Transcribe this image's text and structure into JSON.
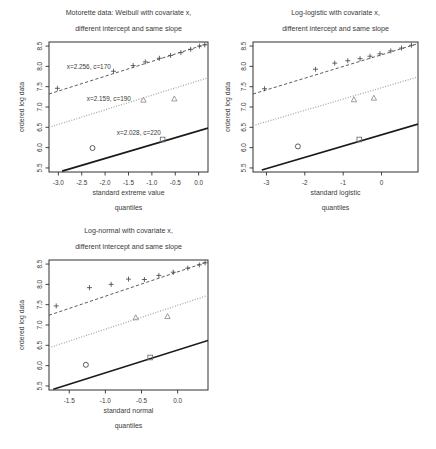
{
  "figure": {
    "panel_count": 3,
    "ylabel_common": "ordered log data",
    "yticks": [
      "5.5",
      "6.0",
      "6.5",
      "7.0",
      "7.5",
      "8.0",
      "8.5"
    ],
    "colors": {
      "line_solid": "#1a1a1a",
      "line_dashed": "#4a4a4a",
      "line_dotted": "#a8a8a8",
      "frame": "#303030",
      "text": "#3a3a3a",
      "background": "#ffffff"
    }
  },
  "chart_data": [
    {
      "type": "scatter",
      "id": "weibull",
      "title_line1": "Motorette data: Weibull with covariate x,",
      "title_line2": "different intercept and same slope",
      "xlabel_line1": "standard extreme value",
      "xlabel_line2": "quantiles",
      "ylabel": "ordered log data",
      "xlim": [
        -3.2,
        0.2
      ],
      "ylim": [
        5.4,
        8.6
      ],
      "xticks": [
        -3.0,
        -2.5,
        -2.0,
        -1.5,
        -1.0,
        -0.5,
        0.0
      ],
      "xticklabels": [
        "-3.0",
        "-2.5",
        "-2.0",
        "-1.5",
        "-1.0",
        "-0.5",
        "0.0"
      ],
      "yticks": [
        5.5,
        6.0,
        6.5,
        7.0,
        7.5,
        8.0,
        8.5
      ],
      "yticklabels": [
        "5.5",
        "6.0",
        "6.5",
        "7.0",
        "7.5",
        "8.0",
        "8.5"
      ],
      "grid": false,
      "annotations": [
        {
          "text": "x=2.256, c=170",
          "x": -2.35,
          "y": 7.93
        },
        {
          "text": "x=2.159, c=190",
          "x": -1.92,
          "y": 7.15
        },
        {
          "text": "x=2.028, c=220",
          "x": -1.28,
          "y": 6.3
        }
      ],
      "series": [
        {
          "name": "c=170",
          "marker": "plus",
          "linestyle": "dashed",
          "fit_line": {
            "x": [
              -3.2,
              0.2
            ],
            "y": [
              7.32,
              8.56
            ]
          },
          "x": [
            -3.02,
            -1.82,
            -1.4,
            -1.14,
            -0.84,
            -0.6,
            -0.38,
            -0.17,
            0.02,
            0.13
          ],
          "y": [
            7.46,
            7.88,
            8.02,
            8.11,
            8.2,
            8.27,
            8.34,
            8.42,
            8.5,
            8.53
          ]
        },
        {
          "name": "c=190",
          "marker": "triangle",
          "linestyle": "dotted",
          "fit_line": {
            "x": [
              -3.2,
              0.2
            ],
            "y": [
              6.5,
              7.72
            ]
          },
          "x": [
            -1.18,
            -0.52
          ],
          "y": [
            7.17,
            7.2
          ]
        },
        {
          "name": "c=220",
          "marker": "square",
          "linestyle": "solid",
          "fit_line": {
            "x": [
              -2.92,
              0.2
            ],
            "y": [
              5.42,
              6.48
            ]
          },
          "x": [
            -0.77
          ],
          "y": [
            6.2
          ]
        },
        {
          "name": "censored",
          "marker": "circle",
          "linestyle": "none",
          "x": [
            -2.27
          ],
          "y": [
            5.99
          ]
        }
      ]
    },
    {
      "type": "scatter",
      "id": "loglogistic",
      "title_line1": "Log-logistic with covariate x,",
      "title_line2": "different intercept and same slope",
      "xlabel_line1": "standard logistic",
      "xlabel_line2": "quantiles",
      "ylabel": "ordered log data",
      "xlim": [
        -3.35,
        0.95
      ],
      "ylim": [
        5.4,
        8.6
      ],
      "xticks": [
        -3,
        -2,
        -1,
        0
      ],
      "xticklabels": [
        "-3",
        "-2",
        "-1",
        "0"
      ],
      "yticks": [
        5.5,
        6.0,
        6.5,
        7.0,
        7.5,
        8.0,
        8.5
      ],
      "yticklabels": [
        "5.5",
        "6.0",
        "6.5",
        "7.0",
        "7.5",
        "8.0",
        "8.5"
      ],
      "grid": false,
      "annotations": [],
      "series": [
        {
          "name": "c=170",
          "marker": "plus",
          "linestyle": "dashed",
          "fit_line": {
            "x": [
              -3.35,
              0.95
            ],
            "y": [
              7.32,
              8.56
            ]
          },
          "x": [
            -3.05,
            -1.72,
            -1.22,
            -0.88,
            -0.56,
            -0.3,
            -0.04,
            0.24,
            0.52,
            0.78
          ],
          "y": [
            7.45,
            7.93,
            8.08,
            8.14,
            8.19,
            8.25,
            8.31,
            8.38,
            8.45,
            8.52
          ]
        },
        {
          "name": "c=190",
          "marker": "triangle",
          "linestyle": "dotted",
          "fit_line": {
            "x": [
              -3.35,
              0.95
            ],
            "y": [
              6.54,
              7.74
            ]
          },
          "x": [
            -0.72,
            -0.2
          ],
          "y": [
            7.18,
            7.22
          ]
        },
        {
          "name": "c=220",
          "marker": "square",
          "linestyle": "solid",
          "fit_line": {
            "x": [
              -3.12,
              0.95
            ],
            "y": [
              5.45,
              6.58
            ]
          },
          "x": [
            -0.58
          ],
          "y": [
            6.2
          ]
        },
        {
          "name": "censored",
          "marker": "circle",
          "linestyle": "none",
          "x": [
            -2.18
          ],
          "y": [
            6.03
          ]
        }
      ]
    },
    {
      "type": "scatter",
      "id": "lognormal",
      "title_line1": "Log-normal with covariate x,",
      "title_line2": "different intercept and same slope",
      "xlabel_line1": "standard normal",
      "xlabel_line2": "quantiles",
      "ylabel": "ordered log data",
      "xlim": [
        -1.78,
        0.42
      ],
      "ylim": [
        5.4,
        8.6
      ],
      "xticks": [
        -1.5,
        -1.0,
        -0.5,
        0.0
      ],
      "xticklabels": [
        "-1.5",
        "-1.0",
        "-0.5",
        "0.0"
      ],
      "yticks": [
        5.5,
        6.0,
        6.5,
        7.0,
        7.5,
        8.0,
        8.5
      ],
      "yticklabels": [
        "5.5",
        "6.0",
        "6.5",
        "7.0",
        "7.5",
        "8.0",
        "8.5"
      ],
      "grid": false,
      "annotations": [],
      "series": [
        {
          "name": "c=170",
          "marker": "plus",
          "linestyle": "dashed",
          "fit_line": {
            "x": [
              -1.78,
              0.42
            ],
            "y": [
              7.24,
              8.56
            ]
          },
          "x": [
            -1.68,
            -1.22,
            -0.92,
            -0.68,
            -0.46,
            -0.26,
            -0.06,
            0.14,
            0.3,
            0.38
          ],
          "y": [
            7.47,
            7.92,
            8.0,
            8.13,
            8.12,
            8.22,
            8.3,
            8.4,
            8.48,
            8.53
          ]
        },
        {
          "name": "c=190",
          "marker": "triangle",
          "linestyle": "dotted",
          "fit_line": {
            "x": [
              -1.78,
              0.42
            ],
            "y": [
              6.44,
              7.73
            ]
          },
          "x": [
            -0.58,
            -0.14
          ],
          "y": [
            7.18,
            7.21
          ]
        },
        {
          "name": "c=220",
          "marker": "square",
          "linestyle": "solid",
          "fit_line": {
            "x": [
              -1.72,
              0.42
            ],
            "y": [
              5.42,
              6.62
            ]
          },
          "x": [
            -0.38
          ],
          "y": [
            6.2
          ]
        },
        {
          "name": "censored",
          "marker": "circle",
          "linestyle": "none",
          "x": [
            -1.27
          ],
          "y": [
            6.02
          ]
        }
      ]
    }
  ]
}
